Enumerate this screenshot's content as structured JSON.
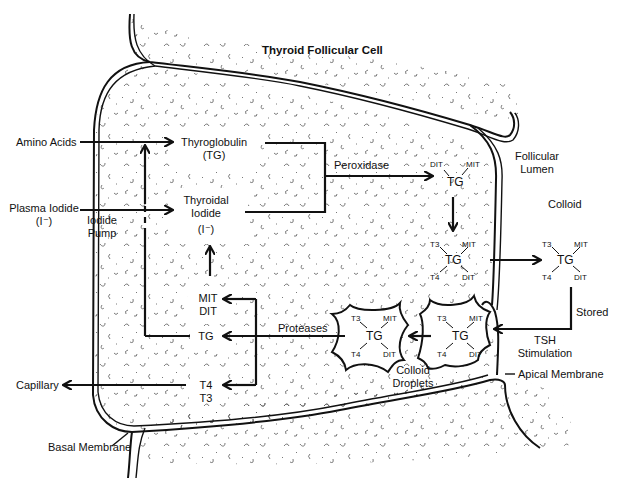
{
  "title": "Thyroid Follicular Cell",
  "inputs": {
    "amino_acids": "Amino Acids",
    "plasma_iodide": "Plasma Iodide",
    "plasma_iodide_symbol": "(I⁻)",
    "iodide_pump_line1": "Iodide",
    "iodide_pump_line2": "Pump",
    "capillary": "Capillary"
  },
  "cell": {
    "thyroglobulin": "Thyroglobulin",
    "thyroglobulin_abbr": "(TG)",
    "thyroidal_iodide_line1": "Thyroidal",
    "thyroidal_iodide_line2": "Iodide",
    "thyroidal_iodide_symbol": "(I⁻)",
    "peroxidase": "Peroxidase",
    "proteases": "Proteases",
    "mit": "MIT",
    "dit": "DIT",
    "tg": "TG",
    "t4": "T4",
    "t3": "T3"
  },
  "lumen": {
    "follicular_line1": "Follicular",
    "follicular_line2": "Lumen",
    "colloid": "Colloid",
    "stored": "Stored",
    "tsh_line1": "TSH",
    "tsh_line2": "Stimulation",
    "colloid_droplets_line1": "Colloid",
    "colloid_droplets_line2": "Droplets"
  },
  "membranes": {
    "apical": "Apical Membrane",
    "basal": "Basal Membrane"
  },
  "molecules": {
    "iodinated_tg": {
      "tl": "DIT",
      "tr": "MIT",
      "center": "TG"
    },
    "coupled_tg": {
      "tl": "T3",
      "tr": "MIT",
      "center": "TG",
      "bl": "T4",
      "br": "DIT"
    }
  }
}
